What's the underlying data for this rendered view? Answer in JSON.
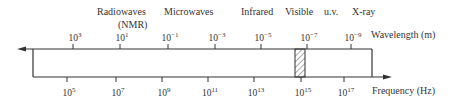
{
  "regions": [
    {
      "name": "Radiowaves",
      "sub": "(NMR)"
    },
    {
      "name": "Microwaves"
    },
    {
      "name": "Infrared"
    },
    {
      "name": "Visible"
    },
    {
      "name": "u.v."
    },
    {
      "name": "X-ray"
    }
  ],
  "wavelength": {
    "label": "Wavelength (m)",
    "ticks": [
      {
        "base": "10",
        "exp": "3"
      },
      {
        "base": "10",
        "exp": "1"
      },
      {
        "base": "10",
        "exp": "−1"
      },
      {
        "base": "10",
        "exp": "−3"
      },
      {
        "base": "10",
        "exp": "−5"
      },
      {
        "base": "10",
        "exp": "−7"
      },
      {
        "base": "10",
        "exp": "−9"
      }
    ]
  },
  "frequency": {
    "label": "Frequency (Hz)",
    "ticks": [
      {
        "base": "10",
        "exp": "5"
      },
      {
        "base": "10",
        "exp": "7"
      },
      {
        "base": "10",
        "exp": "9"
      },
      {
        "base": "10",
        "exp": "11"
      },
      {
        "base": "10",
        "exp": "13"
      },
      {
        "base": "10",
        "exp": "15"
      },
      {
        "base": "10",
        "exp": "17"
      }
    ]
  },
  "colors": {
    "line": "#333333"
  }
}
